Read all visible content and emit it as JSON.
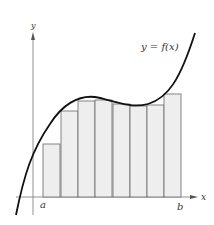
{
  "figure": {
    "function_label": "y = f(x)",
    "x_axis_label": "x",
    "y_axis_label": "y",
    "interval_start_label": "a",
    "interval_end_label": "b"
  },
  "colors": {
    "curve": "#111111",
    "rect_fill": "#eeeeee",
    "rect_stroke": "#666666",
    "axis": "#777777"
  },
  "rectangles": [
    {
      "x": 43,
      "top": 144
    },
    {
      "x": 61,
      "top": 111
    },
    {
      "x": 78,
      "top": 101
    },
    {
      "x": 95,
      "top": 100
    },
    {
      "x": 113,
      "top": 104
    },
    {
      "x": 130,
      "top": 106
    },
    {
      "x": 147,
      "top": 105
    },
    {
      "x": 164,
      "top": 94
    }
  ],
  "rect_width": 17,
  "x_axis_y": 197
}
